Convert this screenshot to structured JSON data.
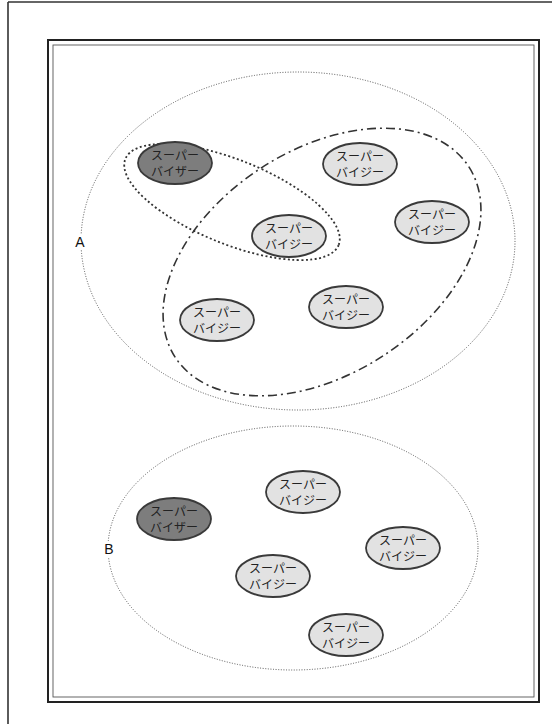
{
  "diagram": {
    "groups": [
      {
        "label": "A",
        "boundary": {
          "cx": 298,
          "cy": 241,
          "rx": 217,
          "ry": 169,
          "style": "fine-dotted"
        },
        "label_pos": {
          "x": 80,
          "y": 247
        },
        "subgroups": [
          {
            "name": "supervisor-pair-loop",
            "style": "dotted",
            "cx": 232,
            "cy": 202,
            "rx": 115,
            "ry": 42,
            "rotate": 22
          },
          {
            "name": "supervisee-group-loop",
            "style": "dash-dot",
            "cx": 322,
            "cy": 262,
            "rx": 175,
            "ry": 112,
            "rotate": -33
          }
        ],
        "nodes": [
          {
            "role": "supervisor",
            "line1": "スーパー",
            "line2": "バイザー",
            "cx": 175,
            "cy": 163
          },
          {
            "role": "supervisee",
            "line1": "スーパー",
            "line2": "バイジー",
            "cx": 360,
            "cy": 164
          },
          {
            "role": "supervisee",
            "line1": "スーパー",
            "line2": "バイジー",
            "cx": 289,
            "cy": 236
          },
          {
            "role": "supervisee",
            "line1": "スーパー",
            "line2": "バイジー",
            "cx": 432,
            "cy": 222
          },
          {
            "role": "supervisee",
            "line1": "スーパー",
            "line2": "バイジー",
            "cx": 217,
            "cy": 320
          },
          {
            "role": "supervisee",
            "line1": "スーパー",
            "line2": "バイジー",
            "cx": 346,
            "cy": 307
          }
        ]
      },
      {
        "label": "B",
        "boundary": {
          "cx": 293,
          "cy": 548,
          "rx": 185,
          "ry": 122,
          "style": "fine-dotted"
        },
        "label_pos": {
          "x": 109,
          "y": 554
        },
        "nodes": [
          {
            "role": "supervisor",
            "line1": "スーパー",
            "line2": "バイザー",
            "cx": 174,
            "cy": 519
          },
          {
            "role": "supervisee",
            "line1": "スーパー",
            "line2": "バイジー",
            "cx": 303,
            "cy": 492
          },
          {
            "role": "supervisee",
            "line1": "スーパー",
            "line2": "バイジー",
            "cx": 403,
            "cy": 548
          },
          {
            "role": "supervisee",
            "line1": "スーパー",
            "line2": "バイジー",
            "cx": 273,
            "cy": 576
          },
          {
            "role": "supervisee",
            "line1": "スーパー",
            "line2": "バイジー",
            "cx": 346,
            "cy": 635
          }
        ]
      }
    ],
    "colors": {
      "supervisor_fill": "#7d7d7d",
      "supervisee_fill": "#e2e2e2",
      "node_stroke": "#3a3a3a",
      "line": "#333333"
    }
  }
}
